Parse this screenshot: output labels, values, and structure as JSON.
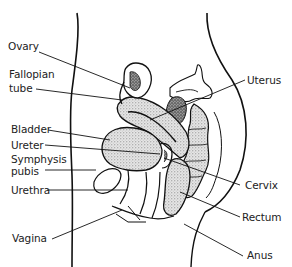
{
  "diagram": {
    "labels": {
      "ovary": "Ovary",
      "fallopian_tube_line1": "Fallopian",
      "fallopian_tube_line2": "tube",
      "bladder": "Bladder",
      "ureter": "Ureter",
      "symphysis_pubis_line1": "Symphysis",
      "symphysis_pubis_line2": "pubis",
      "urethra": "Urethra",
      "vagina": "Vagina",
      "uterus": "Uterus",
      "cervix": "Cervix",
      "rectum": "Rectum",
      "anus": "Anus"
    },
    "colors": {
      "background": "#ffffff",
      "ink": "#111111",
      "text": "#222222",
      "stipple": "#8a8a8a"
    }
  }
}
